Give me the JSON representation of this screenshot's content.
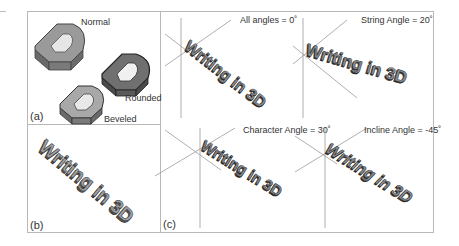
{
  "figure": {
    "panels": {
      "a": {
        "label": "(a)",
        "styles": [
          {
            "name": "Normal",
            "glyph": "D"
          },
          {
            "name": "Rounded",
            "glyph": "D"
          },
          {
            "name": "Beveled",
            "glyph": "D"
          }
        ]
      },
      "b": {
        "label": "(b)",
        "text": "Writing in 3D"
      },
      "c": {
        "label": "(c)",
        "subfigures": [
          {
            "caption": "All angles = 0˚",
            "text": "Writing in 3D"
          },
          {
            "caption": "String Angle = 20˚",
            "text": "Writing in 3D"
          },
          {
            "caption": "Character Angle = 30˚",
            "text": "Writing in 3D"
          },
          {
            "caption": "Incline Angle = -45˚",
            "text": "Writing in 3D"
          }
        ]
      }
    },
    "colors": {
      "frame": "#b8b8b8",
      "face": "#8c8c8c",
      "side": "#5a5a5a",
      "axis": "#9a9a9a"
    }
  }
}
